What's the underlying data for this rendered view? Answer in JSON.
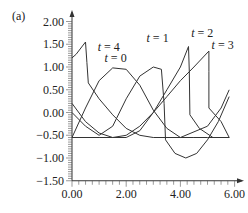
{
  "chart_data": {
    "type": "line",
    "panel_label": "(a)",
    "title": "",
    "xlabel": "",
    "ylabel": "",
    "xlim": [
      0,
      6.2
    ],
    "ylim": [
      -1.5,
      2.0
    ],
    "x_ticks": [
      "0.00",
      "2.00",
      "4.00",
      "6.00"
    ],
    "y_ticks": [
      "2.00",
      "1.50",
      "1.00",
      "0.50",
      "0.00",
      "-0.50",
      "-1.00",
      "-1.50"
    ],
    "grid": false,
    "series": [
      {
        "name": "t = 0",
        "points": [
          [
            0,
            -0.55
          ],
          [
            0.5,
            0.1
          ],
          [
            1.0,
            0.7
          ],
          [
            1.5,
            0.98
          ],
          [
            2.0,
            0.95
          ],
          [
            2.5,
            0.6
          ],
          [
            3.0,
            0.05
          ],
          [
            3.5,
            -0.35
          ],
          [
            4.0,
            -0.55
          ],
          [
            4.5,
            -0.55
          ],
          [
            5.0,
            -0.55
          ],
          [
            5.5,
            -0.55
          ],
          [
            5.8,
            -0.55
          ]
        ]
      },
      {
        "name": "t = 1",
        "points": [
          [
            0,
            0.0
          ],
          [
            0.5,
            -0.3
          ],
          [
            1.0,
            -0.5
          ],
          [
            1.5,
            -0.3
          ],
          [
            2.0,
            0.3
          ],
          [
            2.5,
            0.8
          ],
          [
            3.0,
            1.0
          ],
          [
            3.3,
            0.95
          ],
          [
            3.4,
            0.2
          ],
          [
            3.45,
            -0.6
          ],
          [
            3.8,
            -0.9
          ],
          [
            4.2,
            -1.0
          ],
          [
            4.6,
            -0.9
          ],
          [
            5.0,
            -0.6
          ],
          [
            5.4,
            -0.2
          ],
          [
            5.8,
            0.35
          ]
        ]
      },
      {
        "name": "t = 2",
        "points": [
          [
            0.0,
            0.2
          ],
          [
            0.5,
            -0.2
          ],
          [
            1.0,
            -0.45
          ],
          [
            1.5,
            -0.55
          ],
          [
            2.0,
            -0.55
          ],
          [
            2.5,
            -0.4
          ],
          [
            3.0,
            0.0
          ],
          [
            3.5,
            0.5
          ],
          [
            4.0,
            1.0
          ],
          [
            4.3,
            1.45
          ],
          [
            4.33,
            0.9
          ],
          [
            4.35,
            -0.05
          ],
          [
            4.7,
            -0.35
          ],
          [
            5.2,
            -0.55
          ],
          [
            5.8,
            -0.55
          ]
        ]
      },
      {
        "name": "t = 3",
        "points": [
          [
            0.0,
            -0.55
          ],
          [
            1.0,
            -0.55
          ],
          [
            1.5,
            -0.55
          ],
          [
            2.0,
            -0.5
          ],
          [
            2.5,
            -0.3
          ],
          [
            3.0,
            0.0
          ],
          [
            3.5,
            0.35
          ],
          [
            4.0,
            0.7
          ],
          [
            4.5,
            1.0
          ],
          [
            5.05,
            1.35
          ],
          [
            5.05,
            0.9
          ],
          [
            5.05,
            0.1
          ],
          [
            5.5,
            -0.2
          ],
          [
            5.8,
            -0.55
          ]
        ]
      },
      {
        "name": "t = 4",
        "points": [
          [
            0.0,
            1.2
          ],
          [
            0.15,
            1.28
          ],
          [
            0.5,
            1.55
          ],
          [
            0.55,
            1.1
          ],
          [
            0.6,
            0.65
          ],
          [
            1.0,
            0.3
          ],
          [
            1.5,
            -0.05
          ],
          [
            2.0,
            -0.35
          ],
          [
            2.5,
            -0.5
          ],
          [
            3.0,
            -0.55
          ],
          [
            4.0,
            -0.55
          ],
          [
            5.0,
            -0.3
          ],
          [
            5.5,
            0.1
          ],
          [
            5.8,
            0.5
          ]
        ]
      }
    ],
    "annotations": [
      {
        "text": "t = 4",
        "x": 0.95,
        "y": 1.35
      },
      {
        "text": "t = 0",
        "x": 1.2,
        "y": 1.1
      },
      {
        "text": "t = 1",
        "x": 2.75,
        "y": 1.55
      },
      {
        "text": "t = 2",
        "x": 4.4,
        "y": 1.65
      },
      {
        "text": "t = 3",
        "x": 5.15,
        "y": 1.4
      }
    ]
  }
}
